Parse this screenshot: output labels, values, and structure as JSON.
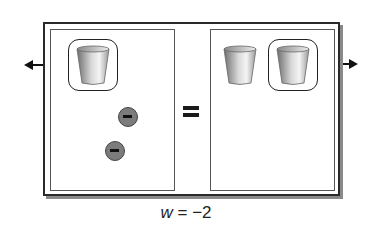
{
  "diagram": {
    "type": "algebra-tiles-equation-mat",
    "left_side": {
      "cups": [
        {
          "label": "x",
          "circled": true,
          "arrow": "left"
        }
      ],
      "counters": [
        {
          "sign": "negative",
          "symbol": "−"
        },
        {
          "sign": "negative",
          "symbol": "−"
        }
      ]
    },
    "equals_symbol": "=",
    "right_side": {
      "cups": [
        {
          "label": "x",
          "circled": false
        },
        {
          "label": "x",
          "circled": true,
          "arrow": "right"
        }
      ],
      "counters": []
    },
    "caption": {
      "variable": "w",
      "operator": "=",
      "value": "−2"
    },
    "colors": {
      "frame": "#2a2a2a",
      "shadow": "#8a8a8a",
      "counter_fill": "#7c7c7c",
      "counter_mark": "#111111",
      "cup_gradient": [
        "#6e6e6e",
        "#f2f2f2"
      ]
    }
  }
}
